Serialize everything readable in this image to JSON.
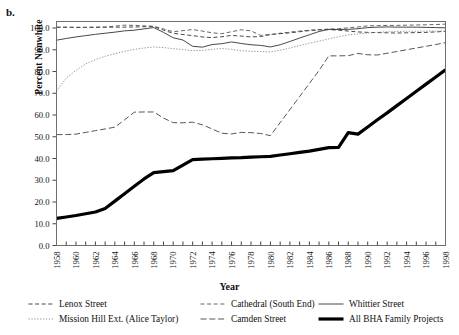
{
  "panel": {
    "letter": "b."
  },
  "axes": {
    "ylabel": "Percent Nonwhite",
    "xlabel": "Year",
    "yticks": [
      "0.0",
      "10.0",
      "20.0",
      "30.0",
      "40.0",
      "50.0",
      "60.0",
      "70.0",
      "80.0",
      "90.0",
      "100.0"
    ],
    "xticks": [
      "1958",
      "1960",
      "1962",
      "1964",
      "1966",
      "1968",
      "1970",
      "1972",
      "1974",
      "1976",
      "1978",
      "1980",
      "1982",
      "1984",
      "1986",
      "1988",
      "1990",
      "1992",
      "1994",
      "1996",
      "1998"
    ]
  },
  "legend": {
    "items": [
      {
        "label": "Lenox Street",
        "style": "dashed-short",
        "row": 0,
        "col": 0
      },
      {
        "label": "Cathedral (South End)",
        "style": "dashed-short",
        "row": 0,
        "col": 1
      },
      {
        "label": "Whittier Street",
        "style": "solid-thin",
        "row": 0,
        "col": 2
      },
      {
        "label": "Mission Hill Ext. (Alice Taylor)",
        "style": "dotted",
        "row": 1,
        "col": 0
      },
      {
        "label": "Camden Street",
        "style": "dashed-long",
        "row": 1,
        "col": 1
      },
      {
        "label": "All BHA Family Projects",
        "style": "solid-bold",
        "row": 1,
        "col": 2
      }
    ]
  },
  "chart_data": {
    "type": "line",
    "title": "",
    "xlabel": "Year",
    "ylabel": "Percent Nonwhite",
    "xlim": [
      1958,
      1998
    ],
    "ylim": [
      0.0,
      103.0
    ],
    "grid": false,
    "legend_position": "bottom",
    "x": [
      1958,
      1959,
      1960,
      1961,
      1962,
      1963,
      1964,
      1965,
      1966,
      1967,
      1968,
      1969,
      1970,
      1971,
      1972,
      1973,
      1974,
      1975,
      1976,
      1977,
      1978,
      1979,
      1980,
      1981,
      1982,
      1983,
      1984,
      1985,
      1986,
      1987,
      1988,
      1989,
      1990,
      1991,
      1992,
      1993,
      1994,
      1995,
      1996,
      1997,
      1998
    ],
    "series": [
      {
        "name": "Lenox Street",
        "style": "dashed-short",
        "color": "#333333",
        "values": [
          100.4,
          100.4,
          100.3,
          100.3,
          100.3,
          100.4,
          100.4,
          100.4,
          100.5,
          100.6,
          100.7,
          99.0,
          97.6,
          97.0,
          96.5,
          95.9,
          95.6,
          96.0,
          96.6,
          96.3,
          95.9,
          96.1,
          97.0,
          97.4,
          97.8,
          98.3,
          98.8,
          99.1,
          99.3,
          99.0,
          98.6,
          98.2,
          98.0,
          97.9,
          97.8,
          97.7,
          97.8,
          97.9,
          98.0,
          98.2,
          98.5
        ]
      },
      {
        "name": "Cathedral (South End)",
        "style": "dashed-short",
        "color": "#555555",
        "values": [
          100.3,
          100.3,
          100.3,
          100.3,
          100.4,
          100.4,
          100.9,
          101.3,
          101.2,
          101.0,
          100.8,
          99.6,
          98.3,
          98.8,
          99.3,
          98.6,
          97.8,
          97.4,
          98.3,
          99.2,
          98.7,
          96.6,
          97.0,
          97.6,
          98.1,
          98.6,
          99.0,
          99.3,
          99.5,
          99.7,
          100.1,
          100.5,
          101.0,
          101.1,
          101.2,
          101.2,
          101.3,
          101.4,
          101.5,
          101.6,
          101.8
        ]
      },
      {
        "name": "Whittier Street",
        "style": "solid-thin",
        "color": "#333333",
        "values": [
          94.4,
          95.2,
          95.9,
          96.5,
          97.1,
          97.6,
          98.1,
          98.7,
          99.0,
          99.6,
          100.2,
          98.0,
          95.5,
          94.5,
          91.6,
          91.2,
          92.4,
          92.8,
          93.6,
          92.9,
          92.3,
          92.0,
          91.3,
          92.3,
          93.8,
          95.4,
          96.9,
          98.4,
          99.4,
          99.3,
          99.4,
          99.7,
          100.2,
          100.4,
          100.5,
          100.4,
          100.4,
          100.4,
          100.3,
          100.2,
          100.1
        ]
      },
      {
        "name": "Mission Hill Ext. (Alice Taylor)",
        "style": "dotted",
        "color": "#8a8a8a",
        "values": [
          71.0,
          77.0,
          80.5,
          83.5,
          85.5,
          87.0,
          88.2,
          89.3,
          90.2,
          90.8,
          91.3,
          91.0,
          90.5,
          90.1,
          89.6,
          89.7,
          90.2,
          90.6,
          90.2,
          89.5,
          89.3,
          89.2,
          89.0,
          89.8,
          90.8,
          91.9,
          93.0,
          94.0,
          95.0,
          96.0,
          96.8,
          97.3,
          97.7,
          98.0,
          98.3,
          98.4,
          98.5,
          98.5,
          98.6,
          98.6,
          98.6
        ]
      },
      {
        "name": "Camden Street",
        "style": "dashed-long",
        "color": "#444444",
        "values": [
          51.0,
          51.0,
          51.2,
          52.0,
          52.8,
          53.6,
          54.4,
          57.8,
          61.3,
          61.4,
          61.4,
          58.6,
          56.5,
          56.4,
          56.7,
          55.5,
          53.6,
          51.6,
          51.3,
          52.0,
          51.9,
          51.5,
          50.5,
          56.5,
          62.5,
          68.5,
          74.5,
          80.5,
          87.2,
          87.2,
          87.3,
          88.3,
          87.7,
          87.6,
          88.4,
          89.2,
          90.0,
          90.8,
          91.6,
          92.4,
          93.3
        ]
      },
      {
        "name": "All BHA Family Projects",
        "style": "solid-bold",
        "color": "#000000",
        "values": [
          12.5,
          13.1,
          13.8,
          14.6,
          15.4,
          17.0,
          20.4,
          23.8,
          27.2,
          30.6,
          33.5,
          34.0,
          34.4,
          37.0,
          39.5,
          39.7,
          39.9,
          40.1,
          40.3,
          40.4,
          40.6,
          40.8,
          41.0,
          41.6,
          42.2,
          42.8,
          43.4,
          44.2,
          45.0,
          45.1,
          51.9,
          51.2,
          54.5,
          57.8,
          61.0,
          64.3,
          67.6,
          70.9,
          74.2,
          77.5,
          80.8
        ]
      }
    ]
  }
}
